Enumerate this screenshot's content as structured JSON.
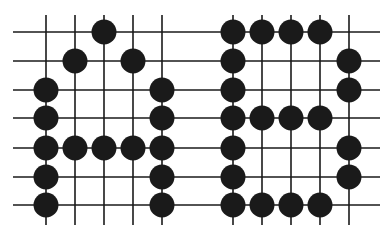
{
  "diagram": {
    "rows": 7,
    "letters": [
      {
        "letter": "A",
        "columns": 5,
        "stones": [
          [
            0,
            2
          ],
          [
            1,
            1
          ],
          [
            1,
            3
          ],
          [
            2,
            0
          ],
          [
            2,
            4
          ],
          [
            3,
            0
          ],
          [
            3,
            4
          ],
          [
            4,
            0
          ],
          [
            4,
            1
          ],
          [
            4,
            2
          ],
          [
            4,
            3
          ],
          [
            4,
            4
          ],
          [
            5,
            0
          ],
          [
            5,
            4
          ],
          [
            6,
            0
          ],
          [
            6,
            4
          ]
        ]
      },
      {
        "letter": "B",
        "columns": 5,
        "stones": [
          [
            0,
            0
          ],
          [
            0,
            1
          ],
          [
            0,
            2
          ],
          [
            0,
            3
          ],
          [
            1,
            0
          ],
          [
            1,
            4
          ],
          [
            2,
            0
          ],
          [
            2,
            4
          ],
          [
            3,
            0
          ],
          [
            3,
            1
          ],
          [
            3,
            2
          ],
          [
            3,
            3
          ],
          [
            4,
            0
          ],
          [
            4,
            4
          ],
          [
            5,
            0
          ],
          [
            5,
            4
          ],
          [
            6,
            0
          ],
          [
            6,
            1
          ],
          [
            6,
            2
          ],
          [
            6,
            3
          ]
        ]
      }
    ],
    "colors": {
      "stone": "#1a1a1a",
      "line": "#1a1a1a",
      "background": "#ffffff"
    }
  }
}
